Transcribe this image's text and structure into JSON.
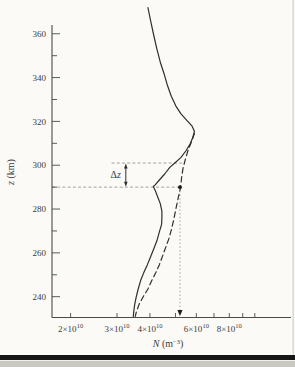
{
  "page": {
    "background": "#fbfaf7",
    "bottom_rule_color": "#161616",
    "margin_color": "#c9c8c3",
    "edge_line_color": "#d6d5d1"
  },
  "chart_data": {
    "type": "line",
    "title": "",
    "xlabel": {
      "var": "N",
      "pre": " (m",
      "sup": "−3",
      "post": ")"
    },
    "ylabel": {
      "var": "z",
      "rest": " (km)"
    },
    "x_scale": "log",
    "x_range_1e10_m3": [
      1.7,
      13.6
    ],
    "y_range_km": [
      230.5,
      364
    ],
    "x_ticks_1e10": [
      2,
      3,
      4,
      5,
      6,
      7,
      8,
      9,
      10
    ],
    "x_tick_labels": [
      {
        "value": 2,
        "mantissa": "2×10",
        "sup": "10"
      },
      {
        "value": 3,
        "mantissa": "3×10",
        "sup": "10"
      },
      {
        "value": 4,
        "mantissa": "4×10",
        "sup": "10"
      },
      {
        "value": 6,
        "mantissa": "6×10",
        "sup": "10"
      },
      {
        "value": 8,
        "mantissa": "8×10",
        "sup": "10"
      }
    ],
    "y_major_ticks_km": [
      240,
      260,
      280,
      300,
      320,
      340,
      360
    ],
    "y_minor_ticks_km": [
      250,
      270,
      290,
      310,
      330,
      350
    ],
    "series": [
      {
        "name": "electron-density-profile-solid",
        "style": "solid",
        "points_N1e10_z_km": [
          [
            3.93,
            372
          ],
          [
            4.03,
            365.5
          ],
          [
            4.14,
            359
          ],
          [
            4.25,
            353
          ],
          [
            4.38,
            347
          ],
          [
            4.52,
            342
          ],
          [
            4.66,
            336.5
          ],
          [
            4.82,
            331.5
          ],
          [
            5.02,
            327
          ],
          [
            5.24,
            323.5
          ],
          [
            5.52,
            320.5
          ],
          [
            5.77,
            318
          ],
          [
            5.9,
            315.5
          ],
          [
            5.81,
            312.5
          ],
          [
            5.67,
            309.5
          ],
          [
            5.47,
            306.5
          ],
          [
            5.24,
            303.5
          ],
          [
            4.97,
            301
          ],
          [
            4.76,
            299
          ],
          [
            4.55,
            296
          ],
          [
            4.36,
            293.5
          ],
          [
            4.19,
            291
          ],
          [
            4.12,
            290.3
          ],
          [
            4.19,
            288.5
          ],
          [
            4.28,
            285.5
          ],
          [
            4.38,
            282.5
          ],
          [
            4.44,
            279
          ],
          [
            4.44,
            276
          ],
          [
            4.43,
            273
          ],
          [
            4.34,
            269.5
          ],
          [
            4.25,
            265.5
          ],
          [
            4.14,
            262
          ],
          [
            4.03,
            258.5
          ],
          [
            3.91,
            254.5
          ],
          [
            3.79,
            251
          ],
          [
            3.69,
            247.5
          ],
          [
            3.61,
            243.5
          ],
          [
            3.55,
            240
          ],
          [
            3.5,
            236.5
          ],
          [
            3.47,
            233
          ],
          [
            3.46,
            231
          ]
        ]
      },
      {
        "name": "electron-density-profile-dashed",
        "style": "dashed",
        "points_N1e10_z_km": [
          [
            5.9,
            314.5
          ],
          [
            5.72,
            310
          ],
          [
            5.57,
            306.5
          ],
          [
            5.45,
            302.5
          ],
          [
            5.35,
            299
          ],
          [
            5.29,
            295.5
          ],
          [
            5.25,
            292
          ],
          [
            5.21,
            289
          ],
          [
            5.13,
            285.5
          ],
          [
            5.06,
            282
          ],
          [
            4.99,
            278.5
          ],
          [
            4.91,
            274.5
          ],
          [
            4.82,
            270.5
          ],
          [
            4.72,
            266.5
          ],
          [
            4.59,
            262.5
          ],
          [
            4.48,
            259
          ],
          [
            4.34,
            254.5
          ],
          [
            4.21,
            251
          ],
          [
            4.07,
            247.5
          ],
          [
            3.93,
            243.5
          ],
          [
            3.77,
            240
          ],
          [
            3.64,
            236.5
          ],
          [
            3.55,
            233
          ],
          [
            3.52,
            231
          ]
        ]
      }
    ],
    "annotations": {
      "delta_z_label": "Δz",
      "upper_ref_line": {
        "z_km": 301,
        "N_from_1e10": 2.86,
        "N_to_1e10": 5.36
      },
      "lower_ref_line": {
        "z_km": 290,
        "N_from_1e10": 1.7,
        "N_to_1e10": 5.2
      },
      "marker_dot": {
        "N_1e10": 5.2,
        "z_km": 290
      },
      "dotted_vertical": {
        "N_1e10": 5.2,
        "z_from_km": 290,
        "z_to_km": 232.5
      },
      "delta_arrow_N_1e10": 3.24,
      "colors": {
        "curve": "#2e2e2e",
        "axis": "#4a4a4a",
        "ref_line": "#9b9a97",
        "marker": "#1d1d1d"
      }
    }
  }
}
